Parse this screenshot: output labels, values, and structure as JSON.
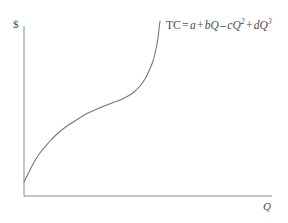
{
  "figure": {
    "background_color": "#ffffff",
    "line_color": "#777777",
    "text_color": "#4a4a4a",
    "y_axis_label": "$",
    "x_axis_label": "Q",
    "equation": {
      "lhs": "TC",
      "equals": "=",
      "term1_coef": "a",
      "op1": "+",
      "term2_coef": "b",
      "term2_var": "Q",
      "op2": "–",
      "term3_coef": "c",
      "term3_var": "Q",
      "term3_exp": "2",
      "op3": "+",
      "term4_coef": "d",
      "term4_var": "Q",
      "term4_exp": "3",
      "full_text": "TC = a + bQ – cQ² + dQ³"
    }
  },
  "chart_data": {
    "type": "line",
    "title": "",
    "xlabel": "Q",
    "ylabel": "$",
    "grid": false,
    "legend": null,
    "axes": {
      "x_axis_pixel_y": 196,
      "y_axis_pixel_x": 24,
      "x_axis_start_px": 24,
      "x_axis_end_px": 272,
      "y_axis_top_px": 26,
      "y_axis_bottom_px": 196,
      "ticks": [],
      "tick_labels": []
    },
    "series": [
      {
        "name": "TC = a + bQ – cQ² + dQ³",
        "description": "Cubic total cost curve: positive intercept, steep initial rise, inflection near the middle, then increasing steeply toward vertical.",
        "points_px": [
          [
            24,
            182
          ],
          [
            26,
            178
          ],
          [
            29,
            172
          ],
          [
            32,
            166
          ],
          [
            36,
            159
          ],
          [
            40,
            153
          ],
          [
            45,
            147
          ],
          [
            50,
            141
          ],
          [
            56,
            135
          ],
          [
            63,
            129
          ],
          [
            70,
            124
          ],
          [
            78,
            119
          ],
          [
            86,
            114
          ],
          [
            95,
            110
          ],
          [
            104,
            106
          ],
          [
            112,
            103
          ],
          [
            120,
            100
          ],
          [
            128,
            96
          ],
          [
            134,
            92
          ],
          [
            140,
            86
          ],
          [
            145,
            79
          ],
          [
            149,
            71
          ],
          [
            153,
            61
          ],
          [
            156,
            49
          ],
          [
            158,
            38
          ],
          [
            159,
            29
          ],
          [
            160,
            21
          ]
        ],
        "inflection_px": [
          115,
          102
        ],
        "start_px": [
          24,
          182
        ],
        "end_px": [
          160,
          21
        ]
      }
    ]
  }
}
